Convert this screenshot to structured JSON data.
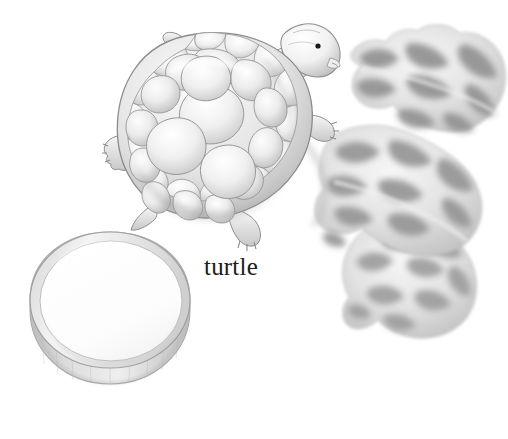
{
  "page": {
    "kind": "illustration-plate",
    "background_color": "#ffffff",
    "width": 508,
    "height": 439,
    "medium": "graphite-pencil-drawing"
  },
  "caption": {
    "label": "turtle",
    "color": "#1b1b1b",
    "font_size_px": 25,
    "x": 204,
    "y": 254
  },
  "palette": {
    "paper": "#ffffff",
    "outline": "#8d8d8d",
    "outline_dark": "#6e6e6e",
    "shell_light": "#f2f2f2",
    "shell_mid": "#d8d8d8",
    "shell_shadow": "#b4b4b4",
    "leaf_light": "#f4f4f4",
    "leaf_mid": "#c8c8c8",
    "leaf_dark": "#9a9a9a",
    "leaf_darkest": "#858585",
    "bowl_rim": "#e8e8e8",
    "bowl_wall": "#cfcfcf",
    "bowl_wall_dark": "#b2b2b2",
    "eye": "#1a1a1a"
  },
  "objects": [
    {
      "name": "turtle",
      "label": "turtle",
      "description": "tortoise seen from above-side, domed segmented shell, head raised to the right, four clawed feet and a short tail",
      "bounds": {
        "x": 104,
        "y": 22,
        "width": 248,
        "height": 232
      },
      "parts": [
        {
          "name": "shell",
          "description": "domed carapace with rounded scutes"
        },
        {
          "name": "head",
          "description": "rounded head facing right with dark round eye"
        },
        {
          "name": "eye",
          "description": "small dark dot"
        },
        {
          "name": "front-left-foot",
          "description": "clawed foot pointing left"
        },
        {
          "name": "front-right-foot",
          "description": "clawed foot under head"
        },
        {
          "name": "rear-foot",
          "description": "clawed foot at lower right of shell"
        },
        {
          "name": "tail",
          "description": "short pointed tail at lower left"
        }
      ]
    },
    {
      "name": "leaves",
      "label": "leaves",
      "description": "three large lobed oak-like leaves in grey pencil shading arranged diagonally behind and under the turtle",
      "bounds": {
        "x": 300,
        "y": 26,
        "width": 208,
        "height": 310
      },
      "count": 3
    },
    {
      "name": "bowl",
      "label": "bowl",
      "description": "shallow round white dish seen in perspective with a thin rim and short shaded side wall",
      "bounds": {
        "x": 28,
        "y": 232,
        "width": 162,
        "height": 172
      }
    }
  ]
}
